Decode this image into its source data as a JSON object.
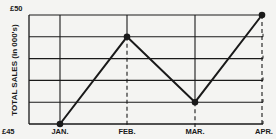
{
  "chart_data": {
    "type": "line",
    "title": "",
    "xlabel": "",
    "ylabel": "TOTAL SALES (in 000's)",
    "categories": [
      "JAN.",
      "FEB.",
      "MAR.",
      "APR."
    ],
    "series": [
      {
        "name": "Total Sales",
        "values": [
          45,
          49,
          46,
          50
        ]
      }
    ],
    "ylim": [
      45,
      50
    ],
    "y_tick_labels": {
      "min": "£45",
      "max": "£50"
    },
    "y_gridlines": [
      45,
      46,
      47,
      48,
      49,
      50
    ],
    "grid": true,
    "legend": "none",
    "line_color": "#1a1a1a",
    "marker": "filled-circle",
    "drop_lines": "dashed from point to x-axis"
  }
}
